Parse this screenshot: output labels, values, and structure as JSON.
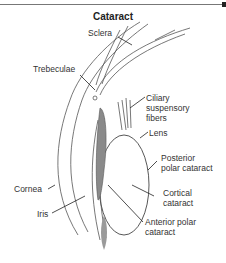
{
  "title": "Cataract",
  "labels": {
    "sclera": "Sclera",
    "trebeculae": "Trebeculae",
    "ciliary_1": "Ciliary",
    "ciliary_2": "suspensory",
    "ciliary_3": "fibers",
    "lens": "Lens",
    "posterior_1": "Posterior",
    "posterior_2": "polar cataract",
    "cortical_1": "Cortical",
    "cortical_2": "cataract",
    "cornea": "Cornea",
    "iris": "Iris",
    "anterior_1": "Anterior polar",
    "anterior_2": "cataract"
  },
  "colors": {
    "line": "#444444",
    "iris_fill": "#8a8a8a",
    "text": "#333333"
  }
}
